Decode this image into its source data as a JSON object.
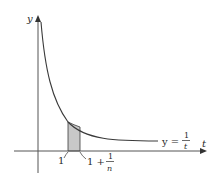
{
  "figure": {
    "type": "function-plot",
    "axes": {
      "x_label": "t",
      "y_label": "y"
    },
    "curve": {
      "label_lhs": "y =",
      "label_num": "1",
      "label_den": "t"
    },
    "markers": {
      "left": "1",
      "right_prefix": "1 +",
      "right_num": "1",
      "right_den": "n"
    },
    "colors": {
      "line": "#3a3a3a",
      "axis": "#555555",
      "shade": "#c8c8c8",
      "background": "#ffffff"
    }
  }
}
